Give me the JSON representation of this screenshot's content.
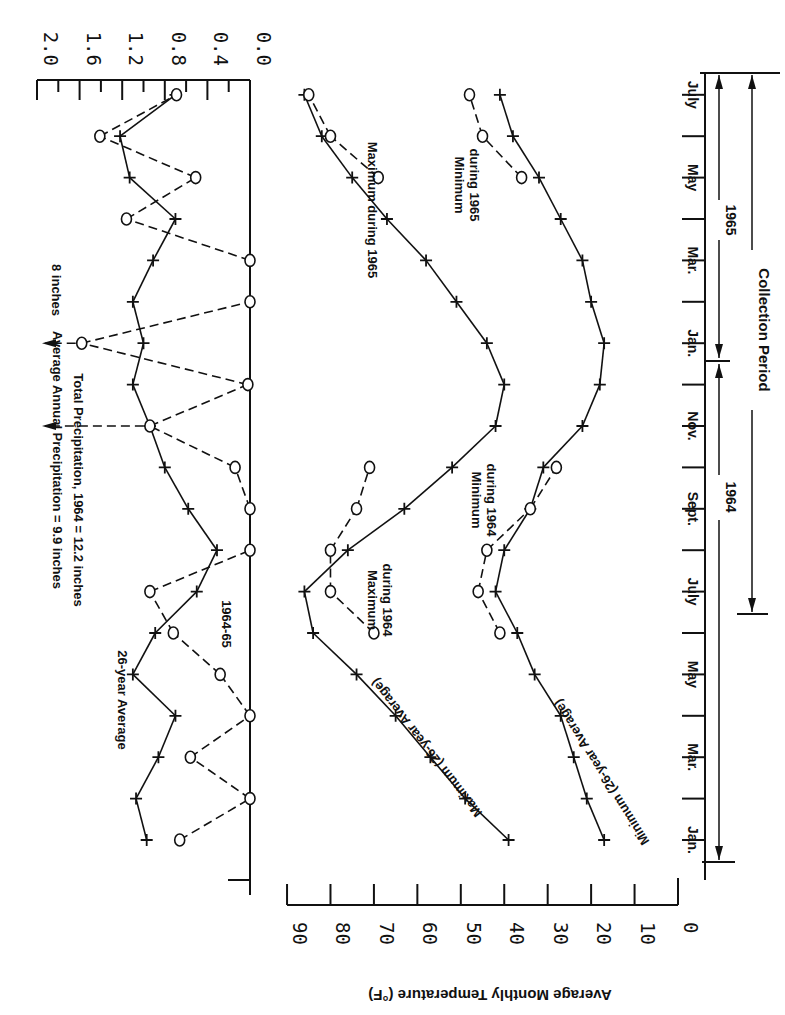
{
  "chart_data": [
    {
      "type": "line",
      "title": "Average Monthly Temperature",
      "ylabel": "Average Monthly Temperature (°F)",
      "xlabel": "Month",
      "ylim": [
        0,
        90
      ],
      "y_ticks": [
        0,
        10,
        20,
        30,
        40,
        50,
        60,
        70,
        80,
        90
      ],
      "orientation_note": "Scanned figure displayed rotated 180 degrees",
      "categories": [
        "Jan 1964",
        "Feb 1964",
        "Mar 1964",
        "Apr 1964",
        "May 1964",
        "Jun 1964",
        "Jul 1964",
        "Aug 1964",
        "Sep 1964",
        "Oct 1964",
        "Nov 1964",
        "Dec 1964",
        "Jan 1965",
        "Feb 1965",
        "Mar 1965",
        "Apr 1965",
        "May 1965",
        "Jun 1965",
        "Jul 1965"
      ],
      "series": [
        {
          "name": "Maximum (26-year Average)",
          "marker": "+",
          "style": "solid",
          "values": [
            39,
            49,
            57,
            65,
            74,
            84,
            86,
            76,
            63,
            52,
            42,
            40,
            44,
            51,
            58,
            67,
            75,
            82,
            86
          ]
        },
        {
          "name": "Maximum during 1964",
          "marker": "o",
          "style": "dashed",
          "values": [
            null,
            null,
            null,
            null,
            null,
            70,
            80,
            80,
            74,
            71,
            null,
            null,
            null,
            null,
            null,
            null,
            null,
            null,
            null
          ]
        },
        {
          "name": "Maximum during 1965",
          "marker": "o",
          "style": "dashed",
          "values": [
            null,
            null,
            null,
            null,
            null,
            null,
            null,
            null,
            null,
            null,
            null,
            null,
            null,
            null,
            null,
            null,
            69,
            80,
            85
          ]
        },
        {
          "name": "Minimum (26-year Average)",
          "marker": "+",
          "style": "solid",
          "values": [
            17,
            21,
            24,
            27,
            33,
            37,
            42,
            40,
            34,
            31,
            22,
            18,
            17,
            20,
            22,
            27,
            32,
            38,
            41
          ]
        },
        {
          "name": "Minimum during 1964",
          "marker": "o",
          "style": "dashed",
          "values": [
            null,
            null,
            null,
            null,
            null,
            41,
            46,
            44,
            34,
            28,
            null,
            null,
            null,
            null,
            null,
            null,
            null,
            null,
            null
          ]
        },
        {
          "name": "Minimum during 1965",
          "marker": "o",
          "style": "dashed",
          "values": [
            null,
            null,
            null,
            null,
            null,
            null,
            null,
            null,
            null,
            null,
            null,
            null,
            null,
            null,
            null,
            null,
            36,
            45,
            48
          ]
        }
      ]
    },
    {
      "type": "line",
      "title": "Monthly Precipitation (inches)",
      "ylabel": "Precipitation (inches)",
      "ylim": [
        0,
        2.0
      ],
      "y_ticks": [
        0.0,
        0.4,
        0.8,
        1.2,
        1.6,
        2.0
      ],
      "categories": [
        "Jan 1964",
        "Feb 1964",
        "Mar 1964",
        "Apr 1964",
        "May 1964",
        "Jun 1964",
        "Jul 1964",
        "Aug 1964",
        "Sep 1964",
        "Oct 1964",
        "Nov 1964",
        "Dec 1964",
        "Jan 1965",
        "Feb 1965",
        "Mar 1965",
        "Apr 1965",
        "May 1965",
        "Jun 1965",
        "Jul 1965"
      ],
      "series": [
        {
          "name": "26-year Average",
          "marker": "+",
          "style": "solid",
          "values": [
            0.97,
            1.07,
            0.86,
            0.7,
            1.1,
            0.89,
            0.5,
            0.31,
            0.58,
            0.8,
            0.94,
            1.1,
            1.0,
            1.1,
            0.91,
            0.7,
            1.13,
            1.22,
            0.7
          ]
        },
        {
          "name": "1964-65",
          "marker": "o",
          "style": "dashed",
          "values": [
            0.66,
            0.0,
            0.56,
            0.0,
            0.28,
            0.72,
            0.94,
            0.0,
            0.0,
            0.14,
            9.9,
            0.02,
            8.0,
            0.0,
            0.0,
            1.16,
            0.51,
            1.41,
            0.69
          ],
          "offscale": {
            "Nov 1964": "9.9 inches (arrow)",
            "Jan 1965": "8 inches (arrow)"
          }
        }
      ],
      "annotations": [
        "Average Annual Precipitation = 9.9 inches",
        "Total Precipitation, 1964 = 12.2 inches",
        "8 inches"
      ]
    }
  ],
  "axes": {
    "temp_ticks": [
      "0",
      "10",
      "20",
      "30",
      "40",
      "50",
      "60",
      "70",
      "80",
      "90"
    ],
    "temp_title": "Average Monthly Temperature (°F)",
    "precip_ticks": [
      "0.0",
      "0.4",
      "0.8",
      "1.2",
      "1.6",
      "2.0"
    ],
    "months": [
      {
        "label": "Jan.",
        "index": 0
      },
      {
        "label": "Mar.",
        "index": 2
      },
      {
        "label": "May",
        "index": 4
      },
      {
        "label": "July",
        "index": 6
      },
      {
        "label": "Sept.",
        "index": 8
      },
      {
        "label": "Nov.",
        "index": 10
      },
      {
        "label": "Jan.",
        "index": 12
      },
      {
        "label": "Mar.",
        "index": 14
      },
      {
        "label": "May",
        "index": 16
      },
      {
        "label": "July",
        "index": 18
      }
    ]
  },
  "labels": {
    "year_1964": "1964",
    "year_1965": "1965",
    "collection_period": "Collection Period",
    "precip_avg_series": "26-year Average",
    "precip_1964_series": "1964-65",
    "avg_annual_precip": "Average Annual Precipitation = 9.9 inches",
    "total_precip_1964": "Total Precipitation, 1964 = 12.2 inches",
    "eight_inches": "8 inches",
    "max_avg": "Maximum (26-year Average)",
    "max_1964": [
      "Maximum",
      "during 1964"
    ],
    "max_1965": "Maximum during 1965",
    "min_avg": "Minimum (26-year Average)",
    "min_1964": [
      "Minimum",
      "during 1964"
    ],
    "min_1965": [
      "Minimum",
      "during 1965"
    ]
  },
  "colors": {
    "ink": "#111111",
    "paper": "#ffffff"
  }
}
